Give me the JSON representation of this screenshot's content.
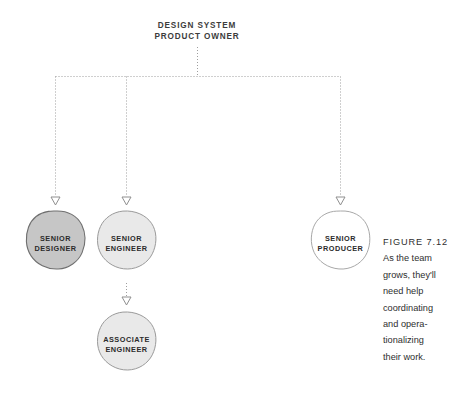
{
  "figure": {
    "root": {
      "label_lines": [
        "DESIGN SYSTEM",
        "PRODUCT OWNER"
      ]
    },
    "nodes": [
      {
        "id": "senior-designer",
        "label_lines": [
          "SENIOR",
          "DESIGNER"
        ],
        "fill": "#c6c6c6",
        "stroke": "#6f6f6f"
      },
      {
        "id": "senior-engineer",
        "label_lines": [
          "SENIOR",
          "ENGINEER"
        ],
        "fill": "#e9e9e9",
        "stroke": "#9a9a9a"
      },
      {
        "id": "senior-producer",
        "label_lines": [
          "SENIOR",
          "PRODUCER"
        ],
        "fill": "#ffffff",
        "stroke": "#a8a8a8"
      },
      {
        "id": "associate-engineer",
        "label_lines": [
          "ASSOCIATE",
          "ENGINEER"
        ],
        "fill": "#e9e9e9",
        "stroke": "#9a9a9a"
      }
    ],
    "connector_color": "#9e9e9e",
    "caption": {
      "title": "FIGURE 7.12",
      "body_lines": [
        "As the team",
        "grows, they'll",
        "need help",
        "coordinating",
        "and opera-",
        "tionalizing",
        "their work."
      ]
    }
  }
}
